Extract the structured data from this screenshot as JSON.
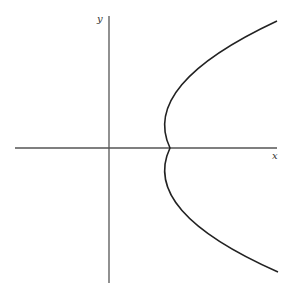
{
  "axes": {
    "x_label": "x",
    "y_label": "y"
  },
  "curve": {
    "type": "parabola",
    "opens": "right",
    "vertex_px": [
      170,
      148
    ],
    "top_end_px": [
      277,
      21
    ],
    "bottom_end_px": [
      278,
      272
    ]
  },
  "colors": {
    "axis": "#555555",
    "curve": "#222222"
  }
}
